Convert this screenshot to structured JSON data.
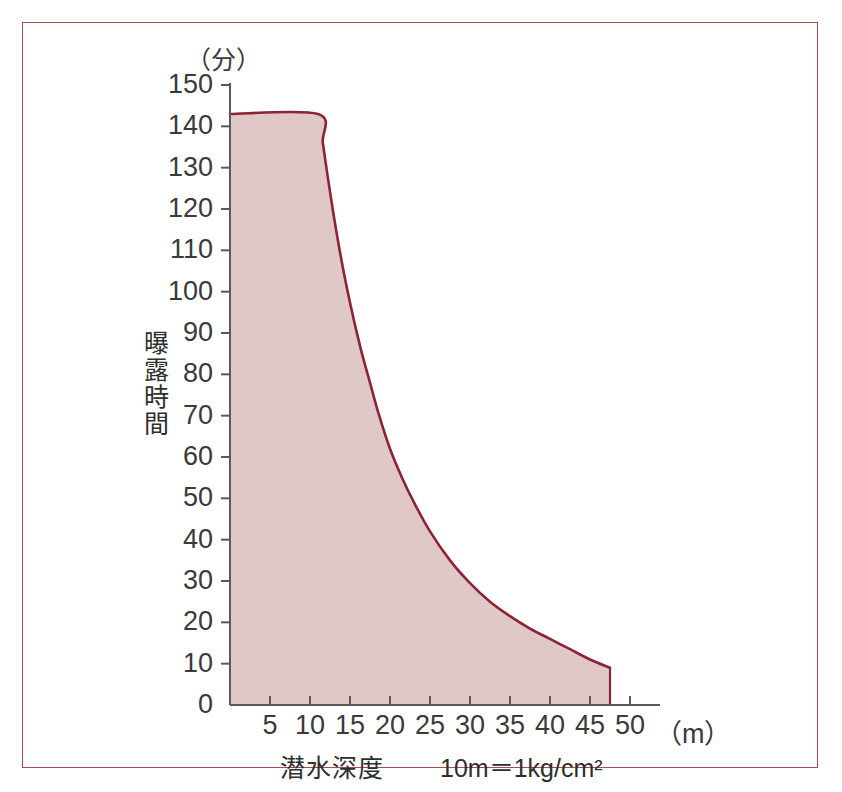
{
  "figure": {
    "frame_color": "#a94a52",
    "background": "#ffffff",
    "bleed_through_text": "",
    "y_unit_label": "（分）",
    "x_unit_label": "（m）",
    "y_axis_title": "曝露時間",
    "x_axis_title": "潜水深度",
    "x_axis_note": "10m＝1kg/cm²"
  },
  "chart_data": {
    "type": "area",
    "title": "",
    "subtitle": "",
    "xlabel": "潜水深度",
    "ylabel": "曝露時間",
    "x_unit": "（m）",
    "y_unit": "（分）",
    "annotation": "10m＝1kg/cm²",
    "xlim": [
      0,
      50
    ],
    "ylim": [
      0,
      150
    ],
    "grid": false,
    "legend": null,
    "x_ticks": [
      5,
      10,
      15,
      20,
      25,
      30,
      35,
      40,
      45,
      50
    ],
    "y_ticks": [
      0,
      10,
      20,
      30,
      40,
      50,
      60,
      70,
      80,
      90,
      100,
      110,
      120,
      130,
      140,
      150
    ],
    "x_tick_labels": [
      "5",
      "10",
      "15",
      "20",
      "25",
      "30",
      "35",
      "40",
      "45",
      "50"
    ],
    "y_tick_labels": [
      "0",
      "10",
      "20",
      "30",
      "40",
      "50",
      "60",
      "70",
      "80",
      "90",
      "100",
      "110",
      "120",
      "130",
      "140",
      "150"
    ],
    "series": [
      {
        "name": "無減圧潜水限界曲線",
        "line_color": "#8b2433",
        "fill_color": "#e0c8c9",
        "x": [
          0,
          11,
          11.6,
          12.2,
          13,
          13.8,
          14.6,
          15.5,
          16.5,
          17.5,
          18.5,
          20,
          21.5,
          23,
          25,
          27.5,
          30,
          32.5,
          35,
          37.5,
          40,
          42.5,
          45,
          47.5
        ],
        "y": [
          143,
          143,
          136,
          128,
          118,
          109,
          101,
          93,
          85,
          78,
          71,
          62,
          55,
          49,
          42,
          35,
          29.5,
          25,
          21.5,
          18.5,
          16,
          13.5,
          11,
          9
        ]
      }
    ]
  }
}
